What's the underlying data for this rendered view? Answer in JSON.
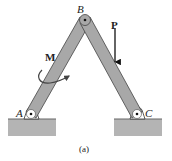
{
  "figure": {
    "caption": "(a)",
    "labels": {
      "B": "B",
      "A": "A",
      "C": "C",
      "P": "P",
      "M": "M"
    },
    "colors": {
      "bar_fill": "#a8a8a8",
      "bar_stroke": "#444444",
      "ground_fill": "#b0b0b0",
      "support_fill": "#ffffff",
      "ink": "#222222"
    }
  }
}
